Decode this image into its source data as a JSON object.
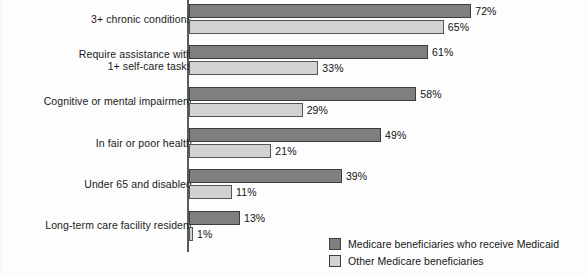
{
  "chart_data": {
    "type": "bar",
    "orientation": "horizontal",
    "title": "",
    "subtitle": "",
    "xlabel": "",
    "ylabel": "",
    "xlim": [
      0,
      75
    ],
    "grid": false,
    "legend_position": "bottom-right",
    "categories": [
      "3+ chronic conditions",
      "Require assistance with\n1+ self-care tasks",
      "Cognitive or mental impairment",
      "In fair or poor health",
      "Under 65 and disabled",
      "Long-term care facility resident"
    ],
    "series": [
      {
        "name": "Medicare beneficiaries who receive Medicaid",
        "color": "#807f7f",
        "values": [
          72,
          61,
          58,
          49,
          39,
          13
        ],
        "value_labels": [
          "72%",
          "61%",
          "58%",
          "49%",
          "39%",
          "13%"
        ]
      },
      {
        "name": "Other Medicare beneficiaries",
        "color": "#d2d2d2",
        "values": [
          65,
          33,
          29,
          21,
          11,
          1
        ],
        "value_labels": [
          "65%",
          "33%",
          "29%",
          "21%",
          "11%",
          "1%"
        ]
      }
    ]
  },
  "legend": {
    "items": [
      {
        "label": "Medicare beneficiaries who receive Medicaid",
        "swatch": "dark"
      },
      {
        "label": "Other Medicare beneficiaries",
        "swatch": "light"
      }
    ]
  },
  "colors": {
    "series_dark": "#807f7f",
    "series_light": "#d2d2d2",
    "axis": "#5a5a5a",
    "text": "#111111",
    "background": "#fdfdfd"
  }
}
